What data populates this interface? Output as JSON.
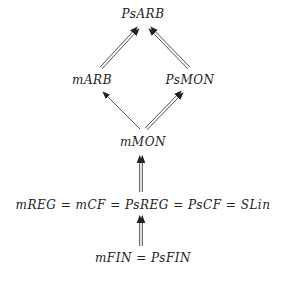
{
  "diagram": {
    "nodes": {
      "psarb": "PsARB",
      "marb": "mARB",
      "psmon": "PsMON",
      "mmon": "mMON",
      "mreg": "mREG = mCF = PsREG = PsCF = SLin",
      "mfin": "mFIN = PsFIN"
    },
    "edges": [
      {
        "from": "mARB",
        "to": "PsARB",
        "style": "double"
      },
      {
        "from": "PsMON",
        "to": "PsARB",
        "style": "double"
      },
      {
        "from": "mMON",
        "to": "mARB",
        "style": "single"
      },
      {
        "from": "mMON",
        "to": "PsMON",
        "style": "double"
      },
      {
        "from": "mREG = mCF = PsREG = PsCF = SLin",
        "to": "mMON",
        "style": "double"
      },
      {
        "from": "mFIN = PsFIN",
        "to": "mREG = mCF = PsREG = PsCF = SLin",
        "style": "double"
      }
    ],
    "colors": {
      "ink": "#222222",
      "background": "#ffffff"
    }
  }
}
